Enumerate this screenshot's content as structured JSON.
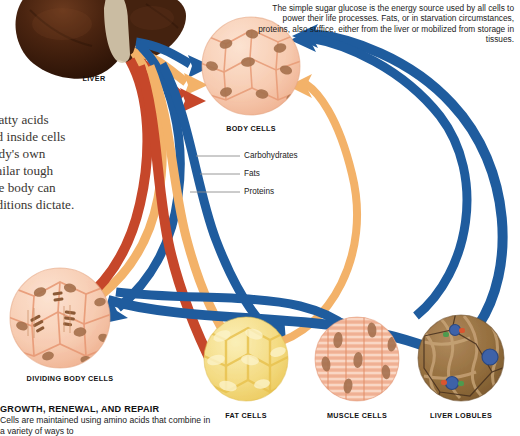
{
  "organs": [
    {
      "id": "liver",
      "label": "LIVER"
    }
  ],
  "tissues": [
    {
      "id": "body-cells",
      "label": "BODY CELLS"
    },
    {
      "id": "dividing-body-cells",
      "label": "DIVIDING BODY CELLS"
    },
    {
      "id": "fat-cells",
      "label": "FAT CELLS"
    },
    {
      "id": "muscle-cells",
      "label": "MUSCLE CELLS"
    },
    {
      "id": "liver-lobules",
      "label": "LIVER LOBULES"
    }
  ],
  "legend": {
    "items": [
      {
        "label": "Carbohydrates",
        "color": "#1F5C9E"
      },
      {
        "label": "Fats",
        "color": "#F3B269"
      },
      {
        "label": "Proteins",
        "color": "#C6472A"
      }
    ]
  },
  "notes": {
    "glucose": "The simple sugar glucose is the energy source used by all cells to power their life processes. Fats, or in starvation circumstances, proteins, also suffice, either from the liver or mobilized from storage in tissues."
  },
  "side_text": {
    "lines": [
      "fatty acids",
      "nd inside cells",
      "ody's own",
      "milar tough",
      "he body can",
      "nditions dictate."
    ]
  },
  "growth_caption": {
    "title": "GROWTH, RENEWAL, AND REPAIR",
    "body": "Cells are maintained using amino acids that combine in a variety of ways to"
  },
  "palette": {
    "carbohydrate_blue": "#1F5C9E",
    "fat_orange": "#F3B269",
    "protein_red": "#C6472A",
    "liver_brown": "#3B1F10",
    "body_cell_peach": "#F6CDB4",
    "fat_cell_yellow": "#F3D87E",
    "muscle_salmon": "#F3BBA2",
    "lobule_brown": "#9A7348",
    "background": "#FFFFFF"
  }
}
